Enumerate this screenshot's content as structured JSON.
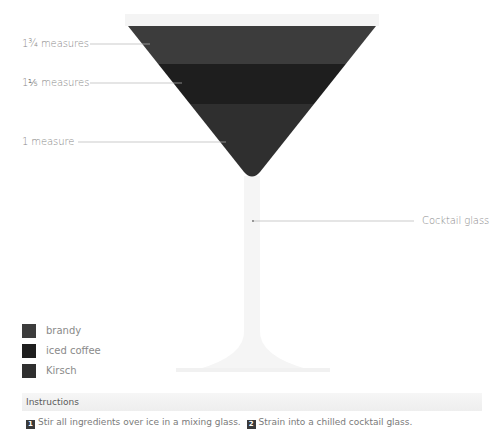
{
  "glass": {
    "name": "Cocktail glass",
    "rim_y": 26,
    "layers": [
      {
        "ingredient": "brandy",
        "measure": "1¾ measures",
        "color": "#3c3c3c"
      },
      {
        "ingredient": "iced coffee",
        "measure": "1⅕ measures",
        "color": "#1e1e1e"
      },
      {
        "ingredient": "Kirsch",
        "measure": "1 measure",
        "color": "#2f2f2f"
      }
    ]
  },
  "callouts": {
    "layer1": "1¾ measures",
    "layer2": "1⅕ measures",
    "layer3": "1 measure",
    "glass": "Cocktail glass"
  },
  "legend": [
    {
      "label": "brandy",
      "color": "#3c3c3c"
    },
    {
      "label": "iced coffee",
      "color": "#1e1e1e"
    },
    {
      "label": "Kirsch",
      "color": "#2f2f2f"
    }
  ],
  "instructions": {
    "title": "Instructions",
    "steps": [
      {
        "num": "1",
        "text": "Stir all ingredients over ice in a mixing glass."
      },
      {
        "num": "2",
        "text": "Strain into a chilled cocktail glass."
      }
    ]
  }
}
